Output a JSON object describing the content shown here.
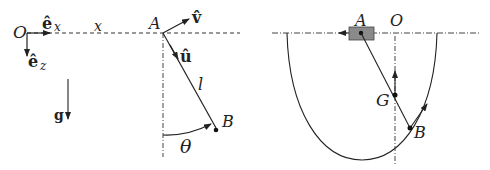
{
  "left_diagram": {
    "labels": {
      "origin": "O",
      "ex_base": "ê",
      "ex_sub": "x",
      "ez_base": "ê",
      "ez_sub": "z",
      "x_axis": "x",
      "point_a": "A",
      "v_hat": "v̂",
      "u_hat": "û",
      "length": "l",
      "point_b": "B",
      "angle": "θ",
      "gravity": "g"
    }
  },
  "right_diagram": {
    "labels": {
      "point_a": "A",
      "origin": "O",
      "point_g": "G",
      "point_b": "B"
    }
  },
  "colors": {
    "stroke": "#222222",
    "block_fill": "#8a8a8a",
    "background": "#ffffff"
  }
}
